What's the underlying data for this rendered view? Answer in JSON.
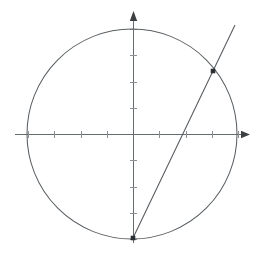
{
  "figure": {
    "background_color": "#ffffff",
    "width": 265,
    "height": 256
  },
  "chart_data": {
    "type": "scatter",
    "title": "",
    "subtitle": "",
    "xlabel": "",
    "ylabel": "",
    "xlim": [
      -1.13,
      1.13
    ],
    "ylim": [
      -1.05,
      1.18
    ],
    "grid": false,
    "legend": false,
    "legend_position": "none",
    "axis_style": {
      "x_axis_visible": true,
      "y_axis_visible": true,
      "x_axis_arrow": "right",
      "y_axis_arrow": "up",
      "tick_labels_shown": false,
      "tick_interval_units": 0.25,
      "axis_color": "#666b6e"
    },
    "x_ticks": [
      -1.0,
      -0.75,
      -0.5,
      -0.25,
      0.25,
      0.5,
      0.75,
      1.0
    ],
    "y_ticks": [
      -1.0,
      -0.75,
      -0.5,
      -0.25,
      0.25,
      0.5,
      0.75,
      1.0
    ],
    "shapes": [
      {
        "name": "unit-circle",
        "kind": "circle",
        "center": [
          0,
          0
        ],
        "radius": 1.0,
        "color": "#5a5f63",
        "filled": false
      },
      {
        "name": "secant-line",
        "kind": "line",
        "through_points": [
          [
            0,
            -1
          ],
          [
            0.77,
            0.6
          ]
        ],
        "x_intercept": 0.46,
        "slope": 2.08,
        "y_intercept": -1.0,
        "color": "#55595d",
        "endpoints_drawn": [
          [
            0,
            -1
          ],
          [
            0.98,
            1.04
          ]
        ]
      }
    ],
    "points": [
      {
        "name": "bottom-point",
        "x": 0,
        "y": -1,
        "marker": "square",
        "color": "#2b2f33"
      },
      {
        "name": "circle-intersection-point",
        "x": 0.77,
        "y": 0.6,
        "marker": "square",
        "color": "#2b2f33"
      }
    ],
    "annotations": []
  },
  "geometry_px": {
    "origin": {
      "x": 133,
      "y": 134
    },
    "unit_px": 105,
    "x_axis": {
      "start_x": 15,
      "end_x": 250,
      "y": 134
    },
    "y_axis": {
      "x": 133,
      "top_y": 11,
      "bottom_y": 243
    },
    "circle": {
      "cx": 132,
      "cy": 134,
      "r": 105
    },
    "secant": {
      "x1": 133,
      "y1": 238,
      "x2": 235,
      "y2": 25
    },
    "markers": [
      {
        "cx": 133,
        "cy": 238,
        "size": 4
      },
      {
        "cx": 213,
        "cy": 71,
        "size": 4
      }
    ]
  }
}
